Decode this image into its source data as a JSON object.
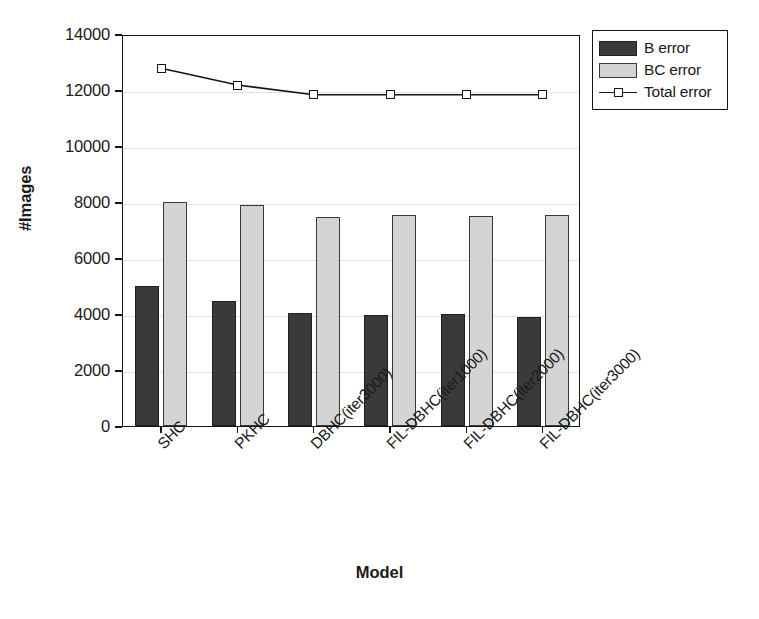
{
  "chart_data": {
    "type": "bar",
    "title": "",
    "xlabel": "Model",
    "ylabel": "#Images",
    "categories": [
      "SHC",
      "PKHC",
      "DBHC(iter3000)",
      "FIL-DBHC(iter1000)",
      "FIL-DBHC(iter2000)",
      "FIL-DBHC(iter3000)"
    ],
    "series": [
      {
        "name": "B error",
        "kind": "bar",
        "color": "#3a3a3a",
        "values": [
          5000,
          4450,
          4050,
          3950,
          4000,
          3900
        ]
      },
      {
        "name": "BC error",
        "kind": "bar",
        "color": "#d4d4d4",
        "values": [
          8000,
          7900,
          7450,
          7550,
          7500,
          7550
        ]
      },
      {
        "name": "Total error",
        "kind": "line",
        "color": "#141414",
        "marker": "square",
        "values": [
          12850,
          12250,
          11900,
          11900,
          11900,
          11900
        ]
      }
    ],
    "ylim": [
      0,
      14000
    ],
    "ytick_values": [
      0,
      2000,
      4000,
      6000,
      8000,
      10000,
      12000,
      14000
    ],
    "ytick_labels": [
      "0",
      "2000",
      "4000",
      "6000",
      "8000",
      "10000",
      "12000",
      "14000"
    ],
    "grid": true,
    "grid_axis": "y",
    "legend_position": "outside-top-right",
    "xtick_label_rotation": -45
  },
  "legend": {
    "entries": [
      {
        "label": "B error",
        "swatch": "bar-dark-swatch"
      },
      {
        "label": "BC error",
        "swatch": "bar-light-swatch"
      },
      {
        "label": "Total error",
        "swatch": "line-square-marker"
      }
    ]
  },
  "axes": {
    "y_title": "#Images",
    "x_title": "Model"
  }
}
